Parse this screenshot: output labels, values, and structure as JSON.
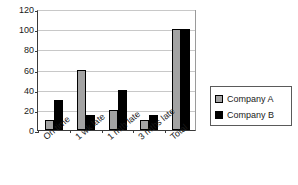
{
  "chart_data": {
    "type": "bar",
    "title": "",
    "subtitle": "",
    "xlabel": "",
    "ylabel": "",
    "categories": [
      "On time",
      "1 wk late",
      "1 mth late",
      "3 mths late",
      "Total"
    ],
    "series": [
      {
        "name": "Company A",
        "color": "#a3a3a3",
        "values": [
          10,
          60,
          20,
          10,
          100
        ]
      },
      {
        "name": "Company B",
        "color": "#000000",
        "values": [
          30,
          15,
          40,
          15,
          100
        ]
      }
    ],
    "ylim": [
      0,
      120
    ],
    "yticks": [
      0,
      20,
      40,
      60,
      80,
      100,
      120
    ],
    "ytick_labels": [
      "0",
      "20",
      "40",
      "60",
      "80",
      "100",
      "120"
    ],
    "grid": true,
    "legend_position": "right"
  },
  "legend": {
    "items": [
      {
        "label": "Company A",
        "swatch": "series-a-swatch"
      },
      {
        "label": "Company B",
        "swatch": "series-b-swatch"
      }
    ]
  },
  "colors": {
    "series_a": "#a3a3a3",
    "series_b": "#000000",
    "gridline": "#c8c8c8",
    "axis": "#3a3a3a",
    "text": "#1a1a1a",
    "background": "#ffffff"
  }
}
